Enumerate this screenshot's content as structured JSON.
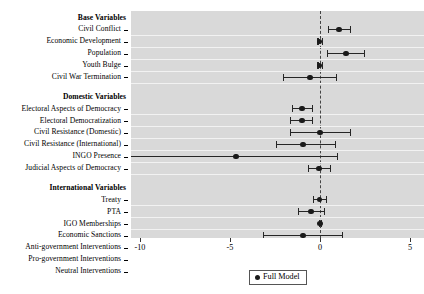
{
  "chart_data": {
    "type": "scatter",
    "title": "",
    "subtitle": "",
    "xlabel": "",
    "ylabel": "",
    "xlim": [
      -11.7,
      5.8
    ],
    "xticks": [
      -10,
      -5,
      0,
      5
    ],
    "xticklabels": [
      "-10",
      "-5",
      "0",
      "5"
    ],
    "grid": true,
    "grid_orientation": "horizontal",
    "zero_reference_line": 0,
    "legend": {
      "position": "bottom-center",
      "entries": [
        {
          "label": "Full Model",
          "marker": "circle",
          "color": "#1a1a1a"
        }
      ]
    },
    "groups": [
      {
        "name": "Base Variables",
        "rows": [
          {
            "label": "Civil Conflict",
            "estimate": 1.05,
            "ci_low": 0.44,
            "ci_high": 1.67
          },
          {
            "label": "Economic Development",
            "estimate": -0.02,
            "ci_low": -0.15,
            "ci_high": 0.12
          },
          {
            "label": "Population",
            "estimate": 1.45,
            "ci_low": 0.39,
            "ci_high": 2.44
          },
          {
            "label": "Youth Bulge",
            "estimate": -0.02,
            "ci_low": -0.14,
            "ci_high": 0.11
          },
          {
            "label": "Civil War Termination",
            "estimate": -0.55,
            "ci_low": -2.05,
            "ci_high": 0.89
          }
        ]
      },
      {
        "name": "Domestic Variables",
        "rows": [
          {
            "label": "Electoral Aspects of Democracy",
            "estimate": -1.0,
            "ci_low": -1.55,
            "ci_high": -0.44
          },
          {
            "label": "Electoral Democratization",
            "estimate": -1.0,
            "ci_low": -1.66,
            "ci_high": -0.44
          },
          {
            "label": "Civil Resistance (Domestic)",
            "estimate": 0.0,
            "ci_low": -1.67,
            "ci_high": 1.67
          },
          {
            "label": "Civil Resistance (International)",
            "estimate": -0.95,
            "ci_low": -2.44,
            "ci_high": 0.83
          },
          {
            "label": "INGO Presence",
            "estimate": -4.67,
            "ci_low": -11.05,
            "ci_high": 0.94
          },
          {
            "label": "Judicial Aspects of Democracy",
            "estimate": -0.05,
            "ci_low": -0.66,
            "ci_high": 0.55
          }
        ]
      },
      {
        "name": "International Variables",
        "rows": [
          {
            "label": "Treaty",
            "estimate": -0.02,
            "ci_low": -0.39,
            "ci_high": 0.33
          },
          {
            "label": "PTA",
            "estimate": -0.5,
            "ci_low": -1.22,
            "ci_high": 0.22
          },
          {
            "label": "IGO Memberships",
            "estimate": 0.0,
            "ci_low": -0.05,
            "ci_high": 0.05
          },
          {
            "label": "Economic Sanctions",
            "estimate": -0.95,
            "ci_low": -3.17,
            "ci_high": 1.22
          },
          {
            "label": "Anti-government Interventions",
            "estimate": -0.05,
            "ci_low": -0.78,
            "ci_high": 0.67
          },
          {
            "label": "Pro-government Interventions",
            "estimate": 0.22,
            "ci_low": -0.5,
            "ci_high": 0.89
          },
          {
            "label": "Neutral Interventions",
            "estimate": 0.61,
            "ci_low": -0.05,
            "ci_high": 1.28
          }
        ]
      }
    ]
  },
  "colors": {
    "panel_background": "#d9d9d9",
    "grid_line": "#f2f2f2",
    "marker": "#1a1a1a",
    "zero_line": "#444444",
    "text": "#000000"
  }
}
